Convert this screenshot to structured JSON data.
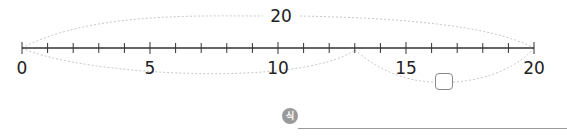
{
  "number_line": {
    "start": 0,
    "end": 20,
    "labels": [
      "0",
      "5",
      "10",
      "15",
      "20"
    ],
    "tick_step": 1
  },
  "top_arc": {
    "from": 0,
    "to": 20,
    "label": "20"
  },
  "bottom_arcs": [
    {
      "from": 0,
      "to": 13,
      "label": ""
    },
    {
      "from": 13,
      "to": 20,
      "label": "answer box (blank)"
    }
  ],
  "answer_box": {
    "value": ""
  },
  "expression": {
    "badge": "식",
    "value": ""
  }
}
